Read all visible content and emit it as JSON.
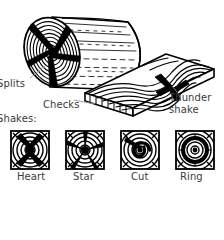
{
  "figure": {
    "title_implicit": "Timber drying defects",
    "background_color": "#ffffff",
    "ink_color": "#000000",
    "text_color": "#3a3a3a"
  },
  "labels": {
    "splits": "Splits",
    "checks": "Checks",
    "thunder_shake": "Thunder shake",
    "thunder_shake_line1": "Thunder",
    "thunder_shake_line2": "shake",
    "shakes_heading": "Shakes:"
  },
  "shake_types": [
    {
      "key": "heart",
      "label": "Heart"
    },
    {
      "key": "star",
      "label": "Star"
    },
    {
      "key": "cut",
      "label": "Cut"
    },
    {
      "key": "ring",
      "label": "Ring"
    }
  ],
  "objects": {
    "log": "log with end-grain growth rings and radial splits",
    "plank": "sawn board with flowing grain, end checks and a thunder shake"
  }
}
